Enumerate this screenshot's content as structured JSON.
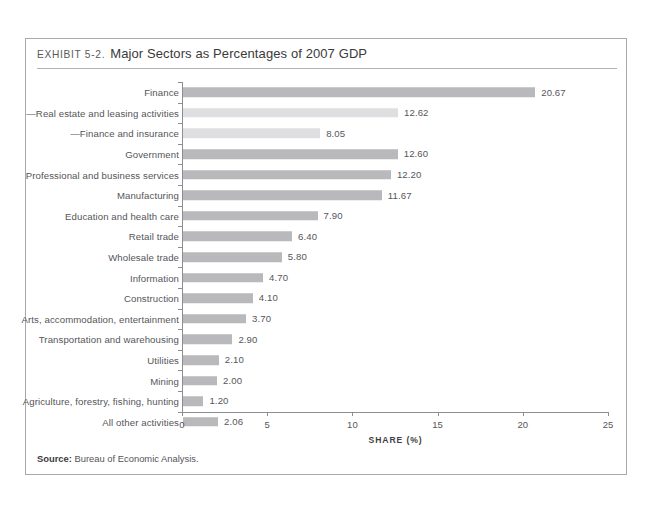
{
  "exhibit": {
    "number": "EXHIBIT 5-2.",
    "title": "Major Sectors as Percentages of 2007 GDP",
    "source_label": "Source:",
    "source_text": "Bureau of Economic Analysis."
  },
  "colors": {
    "bar_main": "#b9b9bb",
    "bar_sub": "#dfdfe1",
    "axis": "#8e8e92",
    "frame": "#a9a9ad",
    "text": "#55555a"
  },
  "chart_data": {
    "type": "bar",
    "orientation": "horizontal",
    "title": "Major Sectors as Percentages of 2007 GDP",
    "xlabel": "SHARE (%)",
    "ylabel": "",
    "xlim": [
      0,
      25
    ],
    "xticks": [
      0,
      5,
      10,
      15,
      20,
      25
    ],
    "grid": false,
    "legend": false,
    "categories": [
      "Finance",
      "—Real estate and leasing activities",
      "—Finance and insurance",
      "Government",
      "Professional and business services",
      "Manufacturing",
      "Education and health care",
      "Retail trade",
      "Wholesale trade",
      "Information",
      "Construction",
      "Arts, accommodation, entertainment",
      "Transportation and warehousing",
      "Utilities",
      "Mining",
      "Agriculture, forestry, fishing, hunting",
      "All other activities"
    ],
    "values": [
      20.67,
      12.62,
      8.05,
      12.6,
      12.2,
      11.67,
      7.9,
      6.4,
      5.8,
      4.7,
      4.1,
      3.7,
      2.9,
      2.1,
      2.0,
      1.2,
      2.06
    ],
    "value_labels": [
      "20.67",
      "12.62",
      "8.05",
      "12.60",
      "12.20",
      "11.67",
      "7.90",
      "6.40",
      "5.80",
      "4.70",
      "4.10",
      "3.70",
      "2.90",
      "2.10",
      "2.00",
      "1.20",
      "2.06"
    ],
    "is_subitem": [
      false,
      true,
      true,
      false,
      false,
      false,
      false,
      false,
      false,
      false,
      false,
      false,
      false,
      false,
      false,
      false,
      false
    ]
  }
}
